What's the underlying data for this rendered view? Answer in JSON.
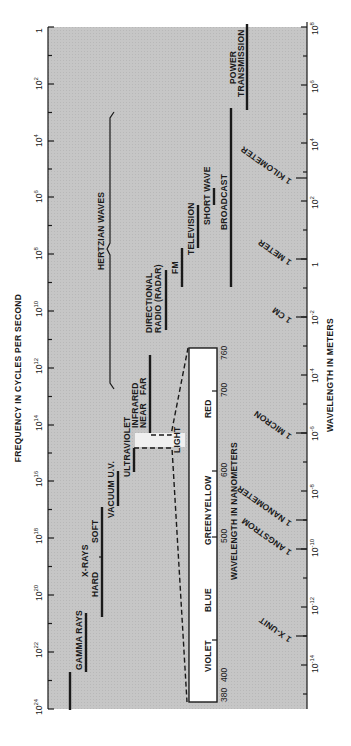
{
  "frequency_axis": {
    "title": "FREQUENCY IN CYCLES PER SECOND",
    "ticks": [
      {
        "exp": "",
        "base": "1",
        "y": 27
      },
      {
        "exp": "2",
        "base": "10",
        "y": 84
      },
      {
        "exp": "4",
        "base": "10",
        "y": 141
      },
      {
        "exp": "6",
        "base": "10",
        "y": 197
      },
      {
        "exp": "8",
        "base": "10",
        "y": 254
      },
      {
        "exp": "10",
        "base": "10",
        "y": 311
      },
      {
        "exp": "12",
        "base": "10",
        "y": 368
      },
      {
        "exp": "14",
        "base": "10",
        "y": 425
      },
      {
        "exp": "16",
        "base": "10",
        "y": 481
      },
      {
        "exp": "18",
        "base": "10",
        "y": 538
      },
      {
        "exp": "20",
        "base": "10",
        "y": 595
      },
      {
        "exp": "22",
        "base": "10",
        "y": 652
      },
      {
        "exp": "24",
        "base": "10",
        "y": 709
      }
    ]
  },
  "wavelength_axis": {
    "title": "WAVELENGTH IN METERS",
    "ticks": [
      {
        "base": "10",
        "exp": "8",
        "y": 27
      },
      {
        "base": "10",
        "exp": "6",
        "y": 85
      },
      {
        "base": "10",
        "exp": "4",
        "y": 143
      },
      {
        "base": "10",
        "exp": "2",
        "y": 201
      },
      {
        "base": "1",
        "exp": "",
        "y": 259
      },
      {
        "base": "10",
        "exp": "-2",
        "y": 317
      },
      {
        "base": "10",
        "exp": "-4",
        "y": 375
      },
      {
        "base": "10",
        "exp": "-6",
        "y": 433
      },
      {
        "base": "10",
        "exp": "-8",
        "y": 491
      },
      {
        "base": "10",
        "exp": "-10",
        "y": 549
      },
      {
        "base": "10",
        "exp": "-12",
        "y": 607
      },
      {
        "base": "10",
        "exp": "-14",
        "y": 665
      }
    ],
    "unit_markers": [
      {
        "label": "1 KILOMETER",
        "y": 178
      },
      {
        "label": "1 METER",
        "y": 259
      },
      {
        "label": "1 CM",
        "y": 317
      },
      {
        "label": "1 MICRON",
        "y": 433
      },
      {
        "label": "1 NANOMETER",
        "y": 520
      },
      {
        "label": "1 ANGSTROM",
        "y": 549
      },
      {
        "label": "1 X-UNIT",
        "y": 636
      }
    ]
  },
  "bands": {
    "gamma_rays": "GAMMA RAYS",
    "x_rays": "X-RAYS",
    "hard": "HARD",
    "soft": "SOFT",
    "vacuum_uv": "VACUUM U.V.",
    "ultraviolet": "ULTRAVIOLET",
    "light": "LIGHT",
    "infrared": "INFRARED",
    "near": "NEAR",
    "far": "FAR",
    "hertzian_waves": "HERTZIAN WAVES",
    "directional_radio_1": "DIRECTIONAL",
    "directional_radio_2": "RADIO (RADAR)",
    "fm": "FM",
    "television": "TELEVISION",
    "short_wave": "SHORT WAVE",
    "broadcast": "BROADCAST",
    "power_transmission_1": "POWER",
    "power_transmission_2": "TRANSMISSION"
  },
  "visible_spectrum": {
    "title": "WAVELENGTH IN NANOMETERS",
    "colors": [
      "VIOLET",
      "BLUE",
      "GREEN",
      "YELLOW",
      "RED"
    ],
    "ticks": [
      "380",
      "400",
      "500",
      "600",
      "700",
      "760"
    ]
  },
  "colors": {
    "band_bg": "#c9c9c9",
    "ink": "#1a1a1a",
    "paper": "#ffffff"
  }
}
